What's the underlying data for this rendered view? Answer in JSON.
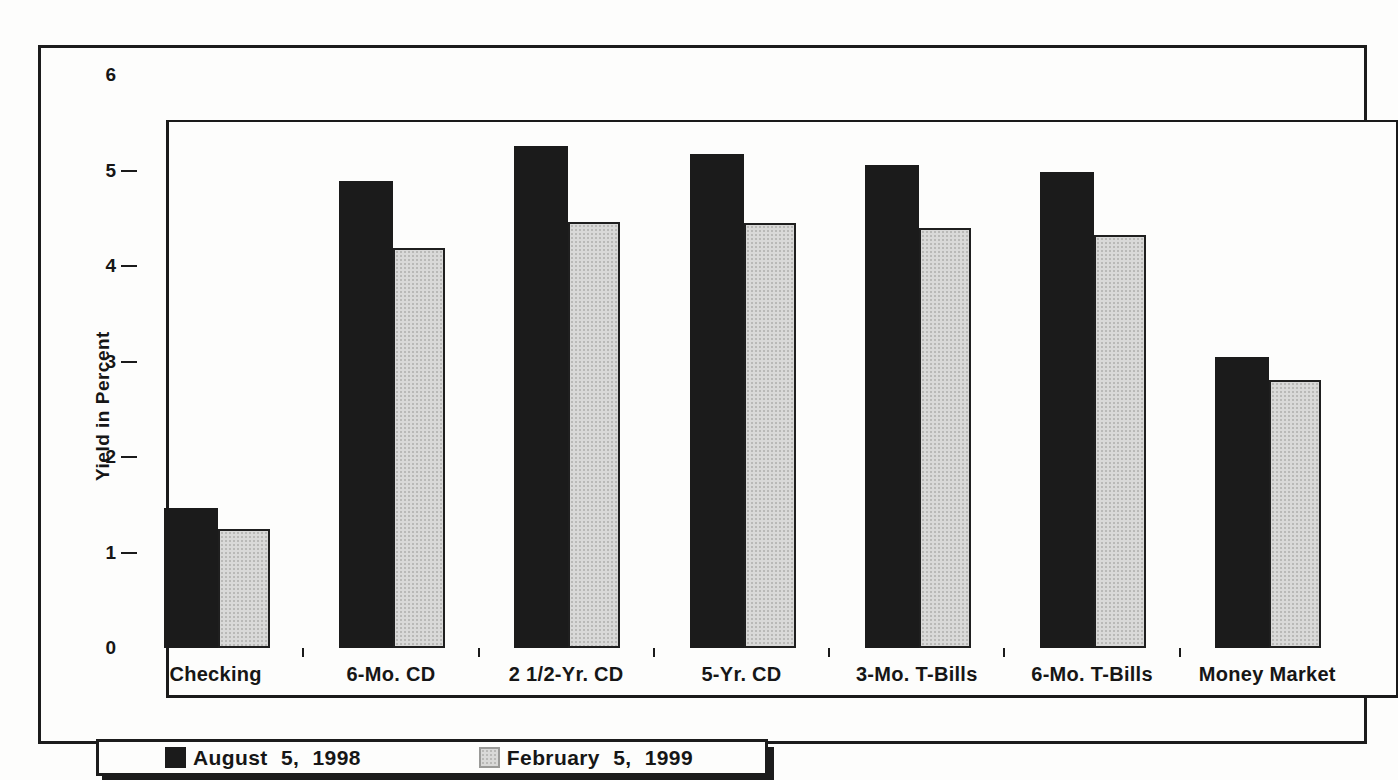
{
  "chart_data": {
    "type": "bar",
    "title": "",
    "xlabel": "",
    "ylabel": "Yield in Percent",
    "ylim": [
      0,
      6
    ],
    "yticks": [
      0,
      1,
      2,
      3,
      4,
      5,
      6
    ],
    "grid": false,
    "legend_position": "bottom-left",
    "categories": [
      "Checking",
      "6-Mo. CD",
      "2 1/2-Yr. CD",
      "5-Yr. CD",
      "3-Mo. T-Bills",
      "6-Mo. T-Bills",
      "Money Market"
    ],
    "series": [
      {
        "name": "August 5, 1998",
        "color": "#1b1b1b",
        "values": [
          1.47,
          4.89,
          5.26,
          5.17,
          5.06,
          4.98,
          3.05
        ]
      },
      {
        "name": "February 5, 1999",
        "color": "#d9d9d8",
        "values": [
          1.25,
          4.19,
          4.46,
          4.45,
          4.4,
          4.32,
          2.81
        ]
      }
    ]
  },
  "colors": {
    "ink": "#1b1b1b",
    "series_aug_1998": "#1b1b1b",
    "series_feb_1999": "#d9d9d8",
    "background": "#fdfdfc"
  }
}
